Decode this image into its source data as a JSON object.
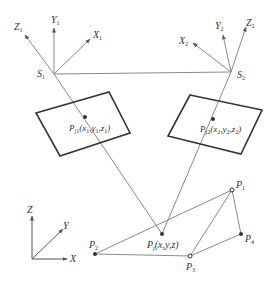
{
  "diagram": {
    "type": "stereo-vision-projection",
    "colors": {
      "line": "#8a8a8a",
      "frame": "#333333",
      "point": "#333333",
      "text": "#333333"
    },
    "camera_left": {
      "origin_label": "S",
      "origin_sub": "1",
      "axis_x": "X",
      "axis_x_sub": "1",
      "axis_y": "Y",
      "axis_y_sub": "1",
      "axis_z": "Z",
      "axis_z_sub": "1"
    },
    "camera_right": {
      "origin_label": "S",
      "origin_sub": "2",
      "axis_x": "X",
      "axis_x_sub": "2",
      "axis_y": "Y",
      "axis_y_sub": "2",
      "axis_z": "Z",
      "axis_z_sub": "2"
    },
    "image_point_left": {
      "label": "P",
      "sub": "j1",
      "coords": "(x",
      "c1sub": "1",
      "c2": ",y",
      "c2sub": "1",
      "c3": ",z",
      "c3sub": "1",
      "close": ")"
    },
    "image_point_right": {
      "label": "P",
      "sub": "j2",
      "coords": "(x",
      "c1sub": "2",
      "c2": ",y",
      "c2sub": "2",
      "c3": ",z",
      "c3sub": "2",
      "close": ")"
    },
    "world_point": {
      "label": "P",
      "sub": "j",
      "coords": "(x,y,z)"
    },
    "world_axes": {
      "x": "X",
      "y": "Y",
      "z": "Z"
    },
    "points": [
      {
        "label": "P",
        "sub": "1"
      },
      {
        "label": "P",
        "sub": "2"
      },
      {
        "label": "P",
        "sub": "3"
      },
      {
        "label": "P",
        "sub": "4"
      }
    ]
  }
}
